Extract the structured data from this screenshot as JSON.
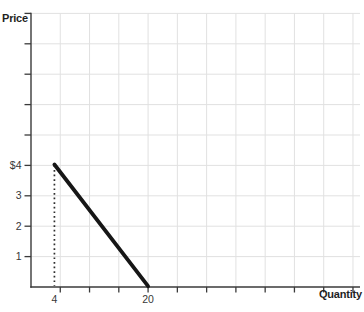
{
  "chart_data": {
    "type": "line",
    "title": "",
    "xlabel": "Quantity",
    "ylabel": "Price",
    "x_axis": {
      "min": 0,
      "max": 56.2,
      "gridlines": [
        5,
        10,
        15,
        20,
        25,
        30,
        35,
        40,
        45,
        50,
        55
      ],
      "tick_labels": [
        {
          "value": 4,
          "text": "4"
        },
        {
          "value": 20,
          "text": "20"
        }
      ]
    },
    "y_axis": {
      "min": 0,
      "max": 9,
      "gridlines": [
        1,
        2,
        3,
        4,
        5,
        6,
        7,
        8,
        9
      ],
      "tick_labels": [
        {
          "value": 4,
          "text": "$4"
        },
        {
          "value": 3,
          "text": "3"
        },
        {
          "value": 2,
          "text": "2"
        },
        {
          "value": 1,
          "text": "1"
        }
      ]
    },
    "series": [
      {
        "name": "demand-curve",
        "points": [
          [
            4,
            4
          ],
          [
            20,
            0
          ]
        ],
        "color": "#161616",
        "stroke_width": 3.8
      }
    ],
    "reference_lines": [
      {
        "name": "dotted-quantity-4",
        "orientation": "vertical",
        "x": 4,
        "y_from": 0,
        "y_to": 4,
        "style": "dotted",
        "color": "#2e2e2e"
      }
    ],
    "grid": true,
    "legend": "none"
  },
  "colors": {
    "background": "#ffffff",
    "gridline": "#e1e1e1",
    "axis": "#3a3a3a",
    "tick_text": "#383838",
    "axis_title_text": "#1f1f1f"
  }
}
